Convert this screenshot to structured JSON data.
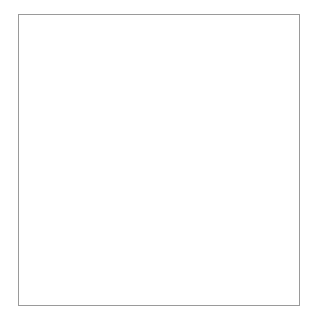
{
  "grid": {
    "type": "blank-coordinate-grid",
    "columns": 7,
    "rows": 7,
    "vertical_gridlines_x": [
      78,
      116,
      154,
      192,
      230,
      268
    ],
    "horizontal_gridlines_y": [
      51,
      90,
      128,
      166,
      205,
      244
    ],
    "axes": {
      "origin": [
        40,
        283
      ],
      "y_axis_top": 22,
      "x_axis_right": 293
    },
    "colors": {
      "axis": "#333333",
      "gridline": "#555555",
      "frame": "#9a9a9a",
      "background": "#ffffff"
    }
  }
}
